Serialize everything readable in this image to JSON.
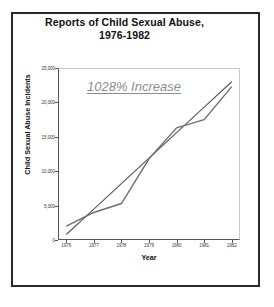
{
  "document": {
    "background_color": "#ffffff",
    "border_color": "#2a2a2a"
  },
  "chart_data": {
    "type": "line",
    "title": "Reports of Child Sexual Abuse,",
    "title_line2": "1976-1982",
    "subtitle": "",
    "xlabel": "Year",
    "ylabel": "Child Sexual Abuse Incidents",
    "x": [
      1976,
      1977,
      1978,
      1979,
      1980,
      1981,
      1982
    ],
    "categories": [
      "1976",
      "1977",
      "1978",
      "1979",
      "1980",
      "1981",
      "1982"
    ],
    "xlim": [
      1975.7,
      1982.3
    ],
    "ylim": [
      0,
      25000
    ],
    "yticks": [
      0,
      5000,
      10000,
      15000,
      20000,
      25000
    ],
    "ytick_labels": [
      "0",
      "5,000",
      "10,000",
      "15,000",
      "20,000",
      "25,000"
    ],
    "xtick_labels": [
      "1976",
      "1977",
      "1978",
      "1979",
      "1980",
      "1981",
      "1982"
    ],
    "grid": false,
    "legend": "none",
    "series": [
      {
        "name": "Child Sexual Abuse Incidents",
        "type": "line",
        "color": "#6e6e6e",
        "values": [
          2000,
          4000,
          5300,
          11800,
          16300,
          17500,
          22300
        ]
      },
      {
        "name": "Trend line",
        "type": "line",
        "color": "#555555",
        "values": [
          800,
          4500,
          8200,
          11900,
          15600,
          19300,
          23000
        ]
      }
    ],
    "annotations": [
      {
        "text": "1028% Increase",
        "color": "#8d8d8d",
        "style": "italic-underline",
        "x": 1977.6,
        "y": 22600
      }
    ]
  }
}
